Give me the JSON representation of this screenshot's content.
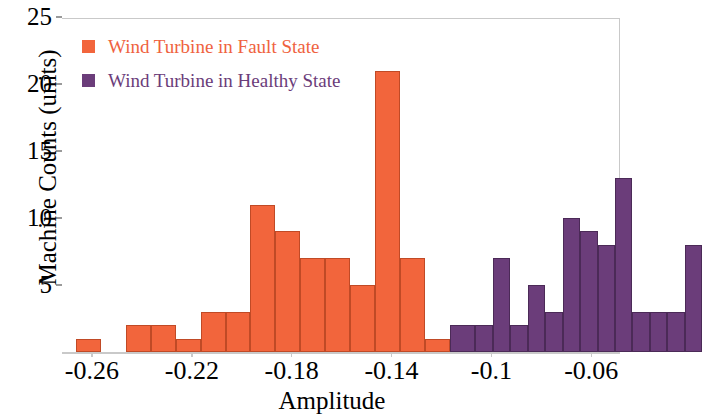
{
  "chart_data": {
    "type": "bar",
    "title": "",
    "xlabel": "Amplitude",
    "ylabel": "Machine Counts (units)",
    "xlim": [
      -0.272,
      -0.0485
    ],
    "ylim": [
      0,
      25
    ],
    "bin_width": 0.01,
    "grid": false,
    "legend_position": "top-left",
    "xticks": [
      "-0.26",
      "-0.22",
      "-0.18",
      "-0.14",
      "-0.1",
      "-0.06"
    ],
    "xtick_values": [
      -0.26,
      -0.22,
      -0.18,
      -0.14,
      -0.1,
      -0.06
    ],
    "yticks": [
      "5",
      "10",
      "15",
      "20",
      "25"
    ],
    "ytick_values": [
      5,
      10,
      15,
      20,
      25
    ],
    "series": [
      {
        "name": "Wind Turbine in Fault State",
        "color": "#f2653c",
        "bins": [
          -0.265,
          -0.255,
          -0.245,
          -0.235,
          -0.225,
          -0.215,
          -0.205,
          -0.195,
          -0.185,
          -0.175,
          -0.165,
          -0.155,
          -0.145,
          -0.135
        ],
        "values": [
          1,
          0,
          2,
          2,
          1,
          3,
          3,
          11,
          9,
          7,
          7,
          5,
          21,
          7
        ]
      },
      {
        "name": "Wind Turbine in Healthy State",
        "color": "#6b3d7a",
        "bins": [
          -0.125,
          -0.115,
          -0.105,
          -0.095,
          -0.085,
          -0.075,
          -0.065,
          -0.055
        ],
        "values": [
          1,
          2,
          7,
          3,
          5,
          3,
          10,
          9,
          8,
          13,
          3,
          2,
          3,
          3,
          8
        ]
      }
    ]
  },
  "legend": {
    "items": [
      {
        "label": "Wind Turbine in Fault State",
        "color": "#f2653c"
      },
      {
        "label": "Wind Turbine in Healthy State",
        "color": "#6b3d7a"
      }
    ]
  },
  "axes": {
    "x_title": "Amplitude",
    "y_title": "Machine Counts (units)",
    "x_labels": [
      "-0.26",
      "-0.22",
      "-0.18",
      "-0.14",
      "-0.1",
      "-0.06"
    ],
    "y_labels": [
      "5",
      "10",
      "15",
      "20",
      "25"
    ]
  },
  "bars": [
    {
      "series": "fault",
      "value": 1,
      "x_left": -0.2665,
      "x_right": -0.2565
    },
    {
      "series": "fault",
      "value": 0,
      "x_left": -0.2565,
      "x_right": -0.2465
    },
    {
      "series": "fault",
      "value": 2,
      "x_left": -0.2465,
      "x_right": -0.2365
    },
    {
      "series": "fault",
      "value": 2,
      "x_left": -0.2365,
      "x_right": -0.2265
    },
    {
      "series": "fault",
      "value": 1,
      "x_left": -0.2265,
      "x_right": -0.2165
    },
    {
      "series": "fault",
      "value": 3,
      "x_left": -0.2165,
      "x_right": -0.2065
    },
    {
      "series": "fault",
      "value": 3,
      "x_left": -0.2065,
      "x_right": -0.1965
    },
    {
      "series": "fault",
      "value": 11,
      "x_left": -0.1965,
      "x_right": -0.1865
    },
    {
      "series": "fault",
      "value": 9,
      "x_left": -0.1865,
      "x_right": -0.1765
    },
    {
      "series": "fault",
      "value": 7,
      "x_left": -0.1765,
      "x_right": -0.1665
    },
    {
      "series": "fault",
      "value": 7,
      "x_left": -0.1665,
      "x_right": -0.1565
    },
    {
      "series": "fault",
      "value": 5,
      "x_left": -0.1565,
      "x_right": -0.1465
    },
    {
      "series": "fault",
      "value": 21,
      "x_left": -0.1465,
      "x_right": -0.1365
    },
    {
      "series": "fault",
      "value": 7,
      "x_left": -0.1365,
      "x_right": -0.1265
    },
    {
      "series": "fault",
      "value": 1,
      "x_left": -0.1265,
      "x_right": -0.1165
    },
    {
      "series": "healthy",
      "value": 2,
      "x_left": -0.1165,
      "x_right": -0.1065
    },
    {
      "series": "healthy",
      "value": 2,
      "x_left": -0.1065,
      "x_right": -0.0995
    },
    {
      "series": "healthy",
      "value": 7,
      "x_left": -0.0995,
      "x_right": -0.0925
    },
    {
      "series": "healthy",
      "value": 2,
      "x_left": -0.0925,
      "x_right": -0.0855
    },
    {
      "series": "healthy",
      "value": 5,
      "x_left": -0.0855,
      "x_right": -0.0785
    },
    {
      "series": "healthy",
      "value": 3,
      "x_left": -0.0785,
      "x_right": -0.0715
    },
    {
      "series": "healthy",
      "value": 10,
      "x_left": -0.0715,
      "x_right": -0.0645
    },
    {
      "series": "healthy",
      "value": 9,
      "x_left": -0.0645,
      "x_right": -0.0575
    },
    {
      "series": "healthy",
      "value": 8,
      "x_left": -0.0575,
      "x_right": -0.0505
    },
    {
      "series": "healthy",
      "value": 13,
      "x_left": -0.0505,
      "x_right": -0.0435
    },
    {
      "series": "healthy",
      "value": 3,
      "x_left": -0.0435,
      "x_right": -0.0365
    },
    {
      "series": "healthy",
      "value": 3,
      "x_left": -0.0365,
      "x_right": -0.0295
    },
    {
      "series": "healthy",
      "value": 3,
      "x_left": -0.0295,
      "x_right": -0.0225
    },
    {
      "series": "healthy",
      "value": 8,
      "x_left": -0.0225,
      "x_right": -0.0155
    }
  ],
  "geometry": {
    "plot_left": 62,
    "plot_right": 620,
    "baseline_y": 352,
    "top_y": 18,
    "y_per_unit": 13.4,
    "bar_width": 26,
    "first_bar_left": 62
  }
}
